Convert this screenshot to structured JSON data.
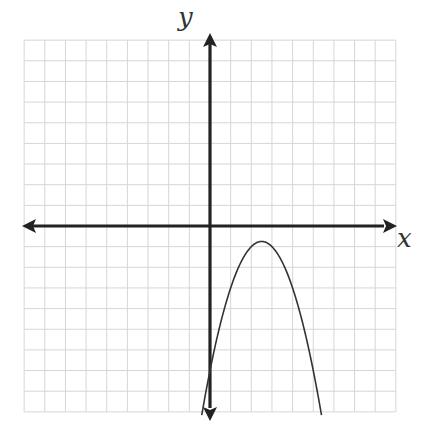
{
  "chart_data": {
    "type": "line",
    "title": "",
    "xlabel": "x",
    "ylabel": "y",
    "xlim": [
      -9,
      9
    ],
    "ylim": [
      -9,
      9
    ],
    "grid": true,
    "grid_step": 1,
    "tick_labels": false,
    "series": [
      {
        "name": "parabola",
        "equation": "y = -(x - 2.5)^2 - 0.75",
        "vertex": [
          2.5,
          -0.75
        ],
        "y_intercept": -7,
        "opens": "down",
        "x": [
          -0.4,
          0,
          0.5,
          1,
          1.5,
          2,
          2.5,
          3,
          3.5,
          4,
          4.5,
          5,
          5.4
        ],
        "y": [
          -9.16,
          -7,
          -4.75,
          -3,
          -1.75,
          -1,
          -0.75,
          -1,
          -1.75,
          -3,
          -4.75,
          -7,
          -9.16
        ]
      }
    ]
  },
  "colors": {
    "grid": "#d6d6d6",
    "axis": "#222222",
    "curve": "#333333",
    "background": "#ffffff"
  }
}
